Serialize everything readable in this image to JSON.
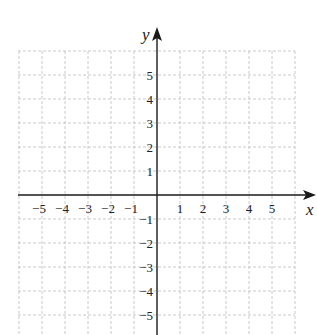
{
  "chart_data": {
    "type": "scatter",
    "title": "",
    "xlabel": "x",
    "ylabel": "y",
    "xlim": [
      -6,
      6
    ],
    "ylim": [
      -6,
      6
    ],
    "grid": true,
    "legend": null,
    "x_ticks": [
      -5,
      -4,
      -3,
      -2,
      -1,
      1,
      2,
      3,
      4,
      5
    ],
    "y_ticks": [
      -5,
      -4,
      -3,
      -2,
      -1,
      1,
      2,
      3,
      4,
      5
    ],
    "x_tick_labels": [
      "−5",
      "−4",
      "−3",
      "−2",
      "−1",
      "1",
      "2",
      "3",
      "4",
      "5"
    ],
    "y_tick_labels": [
      "−5",
      "−4",
      "−3",
      "−2",
      "−1",
      "1",
      "2",
      "3",
      "4",
      "5"
    ],
    "series": []
  },
  "axes": {
    "x_label": "x",
    "y_label": "y"
  },
  "colors": {
    "axis": "#1a1a1a",
    "grid": "#bdbdbd",
    "text": "#222222",
    "background": "#ffffff"
  }
}
